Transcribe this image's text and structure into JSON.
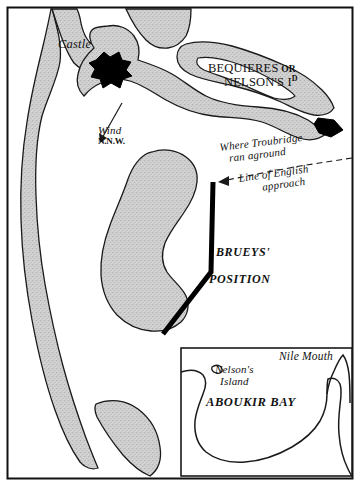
{
  "map": {
    "title": "Battle of the Nile - Aboukir Bay",
    "colors": {
      "ink": "#111111",
      "land_fill": "#cfcfcf",
      "paper": "#ffffff",
      "marker_black": "#000000"
    },
    "frame": {
      "border_label": "map-border"
    },
    "labels": {
      "castle": "Castle",
      "wind": "Wind",
      "wind_direction": "N.N.W.",
      "island_line1": "BEQUIERES",
      "island_or": "OR",
      "island_line2": "NELSON'S",
      "island_abbrev": "I",
      "island_abbrev_sup": "D",
      "troubridge_line1": "Where Troubridge",
      "troubridge_line2": "ran aground",
      "approach_line1": "Line of English",
      "approach_line2": "approach",
      "brueys": "BRUEYS'",
      "position": "POSITION"
    },
    "inset": {
      "nile_mouth": "Nile Mouth",
      "nelsons_island_line1": "Nelson's",
      "nelsons_island_line2": "Island",
      "bay": "ABOUKIR BAY"
    },
    "icons": {
      "castle_marker": "castle-marker-icon",
      "ship_aground_marker": "ship-aground-marker-icon",
      "wind_arrow": "wind-arrow-icon",
      "approach_arrow": "approach-arrow-icon",
      "french_line": "french-fleet-line-icon",
      "nelsons_island_mark": "nelsons-island-mark-icon"
    }
  }
}
